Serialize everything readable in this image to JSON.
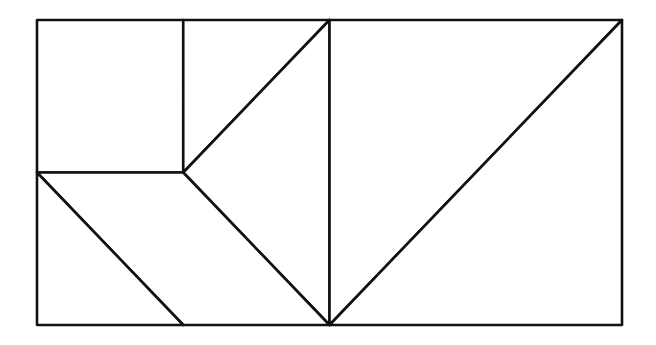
{
  "diagram": {
    "type": "tangram-dissection",
    "stroke_color": "#111111",
    "background_color": "#ffffff",
    "unit_grid": {
      "columns": 4,
      "rows": 2
    },
    "pieces": [
      {
        "id": "square",
        "shape": "square",
        "vertices": [
          [
            0,
            0
          ],
          [
            1,
            0
          ],
          [
            1,
            1
          ],
          [
            0,
            1
          ]
        ]
      },
      {
        "id": "upper-triangle",
        "shape": "right-triangle",
        "vertices": [
          [
            1,
            0
          ],
          [
            2,
            0
          ],
          [
            1,
            1
          ]
        ]
      },
      {
        "id": "middle-triangle",
        "shape": "right-triangle",
        "vertices": [
          [
            1,
            1
          ],
          [
            2,
            0
          ],
          [
            2,
            2
          ]
        ]
      },
      {
        "id": "parallelogram",
        "shape": "parallelogram",
        "vertices": [
          [
            0,
            1
          ],
          [
            1,
            1
          ],
          [
            2,
            2
          ],
          [
            1,
            2
          ]
        ]
      },
      {
        "id": "lower-left-triangle",
        "shape": "right-triangle",
        "vertices": [
          [
            0,
            1
          ],
          [
            1,
            2
          ],
          [
            0,
            2
          ]
        ]
      },
      {
        "id": "large-triangle-upper",
        "shape": "right-triangle",
        "vertices": [
          [
            2,
            0
          ],
          [
            4,
            0
          ],
          [
            2,
            2
          ]
        ]
      },
      {
        "id": "large-triangle-lower",
        "shape": "right-triangle",
        "vertices": [
          [
            4,
            0
          ],
          [
            4,
            2
          ],
          [
            2,
            2
          ]
        ]
      }
    ]
  }
}
